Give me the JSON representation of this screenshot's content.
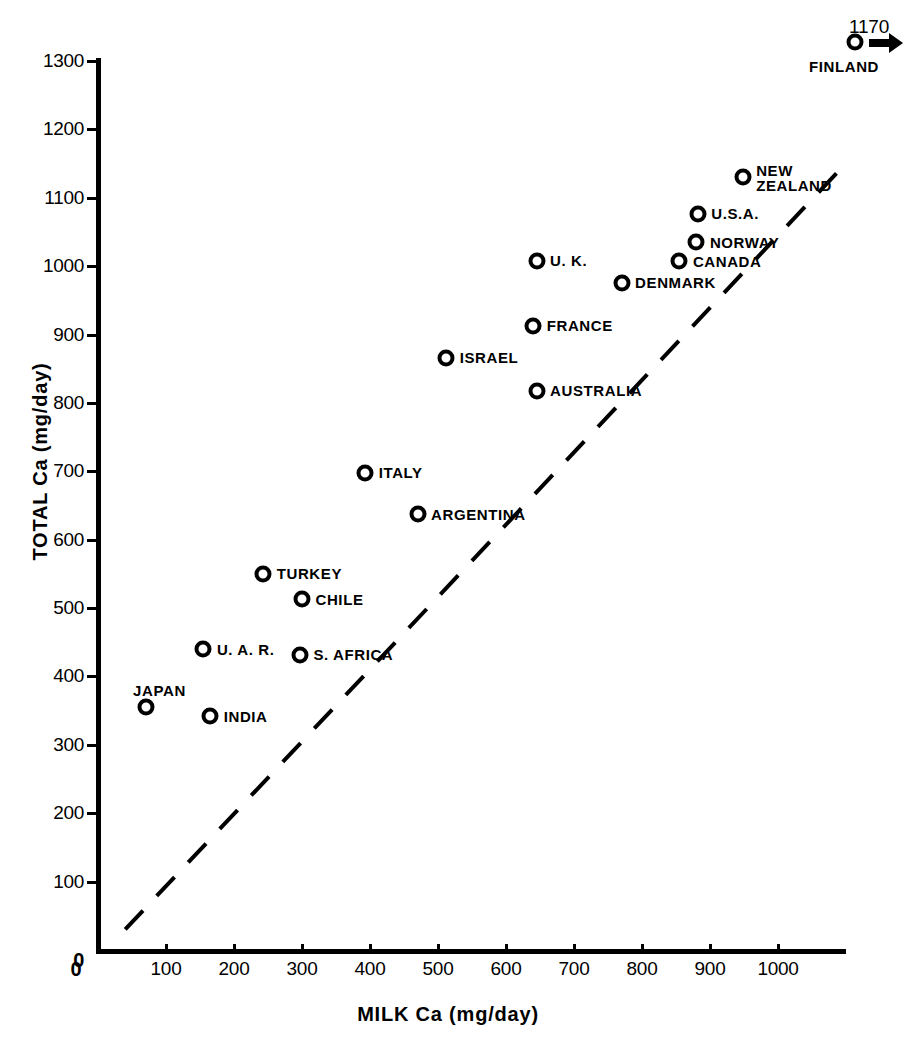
{
  "chart_data": {
    "type": "scatter",
    "title": "",
    "xlabel": "MILK Ca (mg/day)",
    "ylabel": "TOTAL Ca (mg/day)",
    "xlim": [
      0,
      1100
    ],
    "ylim": [
      0,
      1300
    ],
    "xticks": [
      "0",
      "100",
      "200",
      "300",
      "400",
      "500",
      "600",
      "700",
      "800",
      "900",
      "1000"
    ],
    "xtick_values": [
      0,
      100,
      200,
      300,
      400,
      500,
      600,
      700,
      800,
      900,
      1000
    ],
    "yticks": [
      "0",
      "100",
      "200",
      "300",
      "400",
      "500",
      "600",
      "700",
      "800",
      "900",
      "1000",
      "1100",
      "1200",
      "1300"
    ],
    "ytick_values": [
      0,
      100,
      200,
      300,
      400,
      500,
      600,
      700,
      800,
      900,
      1000,
      1100,
      1200,
      1300
    ],
    "grid": false,
    "legend": "none",
    "marker_style": "open-circle",
    "point_color": "#000000",
    "background_color": "#ffffff",
    "points": [
      {
        "label": "JAPAN",
        "x": 70,
        "y": 355,
        "label_pos": "above-right"
      },
      {
        "label": "INDIA",
        "x": 165,
        "y": 342,
        "label_pos": "right"
      },
      {
        "label": "U. A. R.",
        "x": 155,
        "y": 440,
        "label_pos": "right"
      },
      {
        "label": "S. AFRICA",
        "x": 297,
        "y": 432,
        "label_pos": "right"
      },
      {
        "label": "CHILE",
        "x": 300,
        "y": 513,
        "label_pos": "right"
      },
      {
        "label": "TURKEY",
        "x": 243,
        "y": 550,
        "label_pos": "right"
      },
      {
        "label": "ARGENTINA",
        "x": 470,
        "y": 637,
        "label_pos": "right"
      },
      {
        "label": "ITALY",
        "x": 393,
        "y": 698,
        "label_pos": "right"
      },
      {
        "label": "AUSTRALIA",
        "x": 645,
        "y": 818,
        "label_pos": "right"
      },
      {
        "label": "ISRAEL",
        "x": 512,
        "y": 866,
        "label_pos": "right"
      },
      {
        "label": "FRANCE",
        "x": 640,
        "y": 913,
        "label_pos": "right"
      },
      {
        "label": "DENMARK",
        "x": 770,
        "y": 976,
        "label_pos": "right"
      },
      {
        "label": "U. K.",
        "x": 645,
        "y": 1008,
        "label_pos": "right"
      },
      {
        "label": "CANADA",
        "x": 855,
        "y": 1007,
        "label_pos": "right"
      },
      {
        "label": "NORWAY",
        "x": 880,
        "y": 1035,
        "label_pos": "right"
      },
      {
        "label": "U.S.A.",
        "x": 882,
        "y": 1077,
        "label_pos": "right"
      },
      {
        "label": "NEW\nZEALAND",
        "x": 948,
        "y": 1130,
        "label_pos": "right-two-line"
      }
    ],
    "offscale_points": [
      {
        "label": "FINLAND",
        "value_label": "1170",
        "y": 1170,
        "x_offscale": true,
        "arrow": "right",
        "pixel_x": 855,
        "pixel_y": 42
      }
    ],
    "reference_line": {
      "style": "dashed",
      "description": "line of identity",
      "from": [
        40,
        30
      ],
      "to": [
        1090,
        1140
      ]
    }
  }
}
